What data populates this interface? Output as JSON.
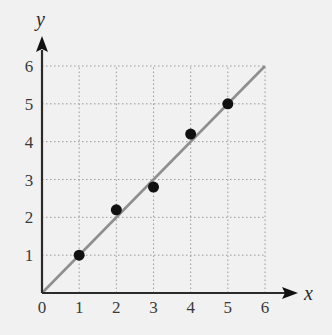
{
  "chart_data": {
    "type": "scatter",
    "title": "",
    "xlabel": "x",
    "ylabel": "y",
    "xlim": [
      0,
      6
    ],
    "ylim": [
      0,
      6
    ],
    "grid": true,
    "grid_style": "dotted",
    "x_ticks": [
      "0",
      "1",
      "2",
      "3",
      "4",
      "5",
      "6"
    ],
    "y_ticks": [
      "1",
      "2",
      "3",
      "4",
      "5",
      "6"
    ],
    "series": [
      {
        "name": "data points",
        "type": "scatter",
        "x": [
          1,
          2,
          3,
          4,
          5
        ],
        "y": [
          1.0,
          2.2,
          2.8,
          4.2,
          5.0
        ],
        "color": "#111111"
      },
      {
        "name": "line y = x",
        "type": "line",
        "x": [
          0,
          6
        ],
        "y": [
          0,
          6
        ],
        "color": "#8f8f8f"
      }
    ]
  },
  "colors": {
    "background": "#f1f1f1",
    "axis": "#2a2a2a",
    "grid": "#9a9a9a",
    "line": "#8f8f8f",
    "points": "#111111"
  }
}
